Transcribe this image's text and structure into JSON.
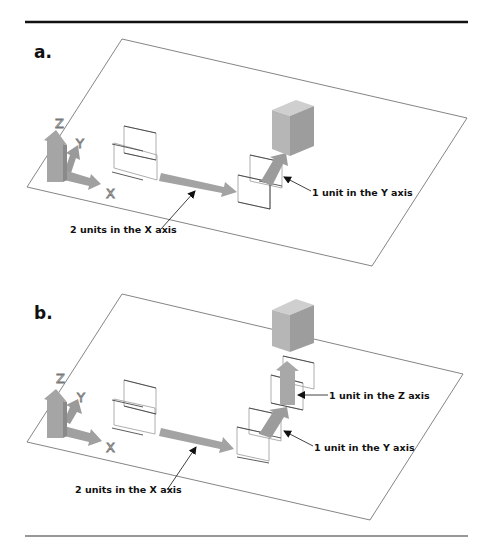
{
  "figure": {
    "panels": [
      {
        "label": "a.",
        "axis_labels": {
          "z": "Z",
          "y": "Y",
          "x": "X"
        },
        "callouts": [
          {
            "text": "2 units in the X axis"
          },
          {
            "text": "1 unit in the Y axis"
          }
        ]
      },
      {
        "label": "b.",
        "axis_labels": {
          "z": "Z",
          "y": "Y",
          "x": "X"
        },
        "callouts": [
          {
            "text": "1 unit in the Z axis"
          },
          {
            "text": "2 units in the X axis"
          },
          {
            "text": "1 unit in the Y axis"
          }
        ]
      }
    ],
    "colors": {
      "rule": "#111111",
      "plane_edge": "#555555",
      "arrow_fill": "#a8a8a8",
      "arrow_dark": "#8f8f8f",
      "cube_front": "#b5b5b5",
      "cube_top": "#c9c9c9",
      "cube_side": "#9a9a9a",
      "wire": "#333333"
    }
  }
}
